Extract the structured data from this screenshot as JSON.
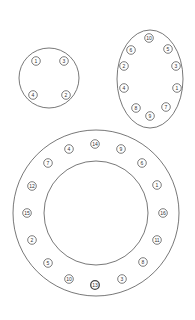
{
  "patterns": [
    {
      "name": "4-bolt circular flange",
      "shape": "circle",
      "outline": {
        "cx": 49,
        "cy": 78,
        "r": 30
      },
      "bolts": [
        {
          "label": "1",
          "x": 36,
          "y": 61
        },
        {
          "label": "3",
          "x": 64,
          "y": 61
        },
        {
          "label": "4",
          "x": 33,
          "y": 95
        },
        {
          "label": "2",
          "x": 66,
          "y": 95
        }
      ]
    },
    {
      "name": "10-bolt oval flange",
      "shape": "ellipse",
      "outline": {
        "cx": 150,
        "cy": 79,
        "rx": 33,
        "ry": 49
      },
      "bolts": [
        {
          "label": "10",
          "x": 149,
          "y": 38
        },
        {
          "label": "6",
          "x": 131,
          "y": 50
        },
        {
          "label": "5",
          "x": 168,
          "y": 49
        },
        {
          "label": "2",
          "x": 124,
          "y": 66
        },
        {
          "label": "3",
          "x": 176,
          "y": 66
        },
        {
          "label": "4",
          "x": 124,
          "y": 88
        },
        {
          "label": "1",
          "x": 177,
          "y": 88
        },
        {
          "label": "8",
          "x": 136,
          "y": 108
        },
        {
          "label": "7",
          "x": 166,
          "y": 107
        },
        {
          "label": "9",
          "x": 150,
          "y": 116
        }
      ]
    },
    {
      "name": "16-bolt ring flange",
      "shape": "ring",
      "outline": {
        "cx": 96,
        "cy": 213,
        "r_outer": 83,
        "r_inner": 52
      },
      "bolts": [
        {
          "label": "14",
          "x": 95,
          "y": 144
        },
        {
          "label": "4",
          "x": 69,
          "y": 149
        },
        {
          "label": "9",
          "x": 121,
          "y": 149
        },
        {
          "label": "7",
          "x": 48,
          "y": 163
        },
        {
          "label": "6",
          "x": 142,
          "y": 163
        },
        {
          "label": "12",
          "x": 32,
          "y": 186
        },
        {
          "label": "1",
          "x": 157,
          "y": 185
        },
        {
          "label": "15",
          "x": 27,
          "y": 213
        },
        {
          "label": "16",
          "x": 163,
          "y": 213
        },
        {
          "label": "2",
          "x": 32,
          "y": 240
        },
        {
          "label": "11",
          "x": 157,
          "y": 240
        },
        {
          "label": "5",
          "x": 48,
          "y": 263
        },
        {
          "label": "8",
          "x": 143,
          "y": 262
        },
        {
          "label": "10",
          "x": 69,
          "y": 279
        },
        {
          "label": "3",
          "x": 122,
          "y": 279
        },
        {
          "label": "13",
          "x": 95,
          "y": 285,
          "emphasis": true
        }
      ]
    }
  ],
  "colors": {
    "stroke": "#444444",
    "background": "#ffffff"
  }
}
